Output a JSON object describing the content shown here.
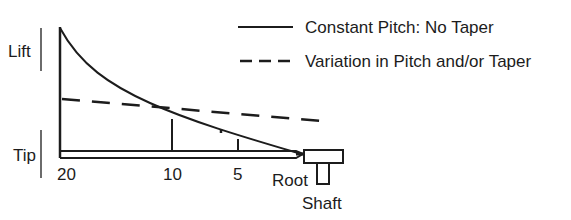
{
  "figure": {
    "type": "propeller blade lift distribution diagram",
    "legend": [
      {
        "style": "solid",
        "label": "Constant Pitch: No Taper"
      },
      {
        "style": "dashed",
        "label": "Variation in Pitch and/or Taper"
      }
    ],
    "y_labels": {
      "upper": "Lift",
      "lower": "Tip"
    },
    "x_labels": [
      "20",
      "10",
      "5",
      "Root"
    ],
    "hub_label": "Shaft",
    "colors": {
      "ink": "#1c1c1c",
      "background": "#ffffff"
    }
  }
}
